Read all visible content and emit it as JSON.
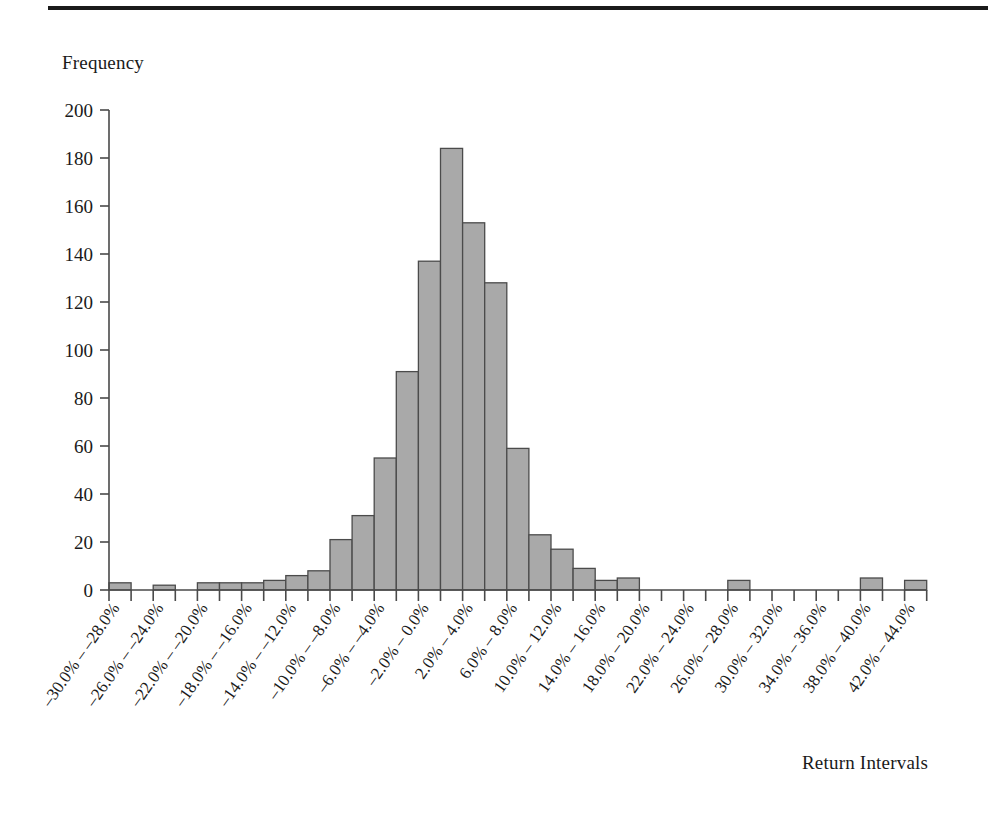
{
  "figure": {
    "ylabel": "Frequency",
    "xlabel": "Return Intervals"
  },
  "chart_data": {
    "type": "bar",
    "title": "",
    "xlabel": "Return Intervals",
    "ylabel": "Frequency",
    "ylim": [
      0,
      200
    ],
    "ytick_values": [
      0,
      20,
      40,
      60,
      80,
      100,
      120,
      140,
      160,
      180,
      200
    ],
    "ytick_labels": [
      "0",
      "20",
      "40",
      "60",
      "80",
      "100",
      "120",
      "140",
      "160",
      "180",
      "200"
    ],
    "grid": false,
    "legend": false,
    "bar_fill_color": "#a9a9a9",
    "bar_edge_color": "#4b4b4b",
    "categories": [
      "-30.0% - -28.0%",
      "-28.0% - -26.0%",
      "-26.0% - -24.0%",
      "-24.0% - -22.0%",
      "-22.0% - -20.0%",
      "-20.0% - -18.0%",
      "-18.0% - -16.0%",
      "-16.0% - -14.0%",
      "-14.0% - -12.0%",
      "-12.0% - -10.0%",
      "-10.0% - -8.0%",
      "-8.0% - -6.0%",
      "-6.0% - -4.0%",
      "-4.0% - -2.0%",
      "-2.0% - 0.0%",
      "0.0% - 2.0%",
      "2.0% - 4.0%",
      "4.0% - 6.0%",
      "6.0% - 8.0%",
      "8.0% - 10.0%",
      "10.0% - 12.0%",
      "12.0% - 14.0%",
      "14.0% - 16.0%",
      "16.0% - 18.0%",
      "18.0% - 20.0%",
      "20.0% - 22.0%",
      "22.0% - 24.0%",
      "24.0% - 26.0%",
      "26.0% - 28.0%",
      "28.0% - 30.0%",
      "30.0% - 32.0%",
      "32.0% - 34.0%",
      "34.0% - 36.0%",
      "36.0% - 38.0%",
      "38.0% - 40.0%",
      "40.0% - 42.0%",
      "42.0% - 44.0%"
    ],
    "visible_tick_labels": [
      "-30.0% - -28.0%",
      "-26.0% - -24.0%",
      "-22.0% - -20.0%",
      "-18.0% - -16.0%",
      "-14.0% - -12.0%",
      "-10.0% - -8.0%",
      "-6.0% - -4.0%",
      "-2.0% - 0.0%",
      "2.0% - 4.0%",
      "6.0% - 8.0%",
      "10.0% - 12.0%",
      "14.0% - 16.0%",
      "18.0% - 20.0%",
      "22.0% - 24.0%",
      "26.0% - 28.0%",
      "30.0% - 32.0%",
      "34.0% - 36.0%",
      "38.0% - 40.0%",
      "42.0% - 44.0%"
    ],
    "values": [
      3,
      0,
      2,
      0,
      3,
      3,
      3,
      4,
      6,
      8,
      21,
      31,
      55,
      91,
      137,
      184,
      153,
      128,
      59,
      23,
      17,
      9,
      4,
      5,
      0,
      0,
      0,
      0,
      4,
      0,
      0,
      0,
      0,
      0,
      5,
      0,
      4
    ]
  }
}
